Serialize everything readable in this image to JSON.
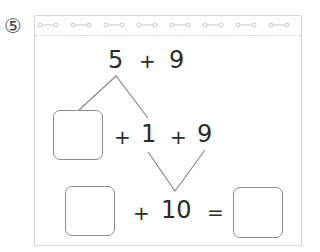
{
  "problem": {
    "number_label": "⑤",
    "top_expression": {
      "a": "5",
      "op": "+",
      "b": "9"
    },
    "row2": {
      "blank": "",
      "op1": "+",
      "a": "1",
      "op2": "+",
      "b": "9"
    },
    "row3": {
      "blank": "",
      "op": "+",
      "ten": "10",
      "eq": "=",
      "answer": ""
    }
  },
  "decoration": {
    "spiral_rings": 8,
    "line_color": "#8a8a8a",
    "border_color": "#d4d4d4"
  }
}
